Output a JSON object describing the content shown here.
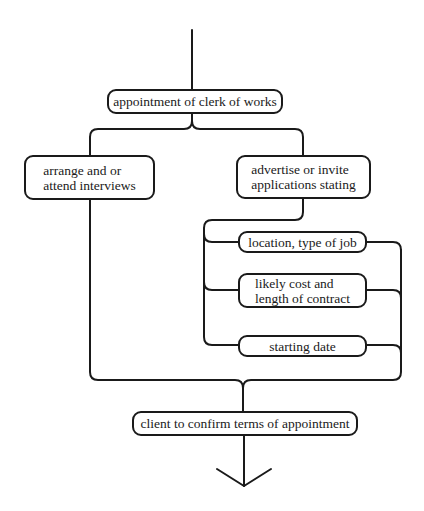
{
  "diagram": {
    "type": "flowchart",
    "colors": {
      "line": "#1a1a1a",
      "background": "#ffffff"
    },
    "nodes": {
      "appointment": {
        "label": "appointment of clerk of works"
      },
      "interviews": {
        "line1": "arrange and or",
        "line2": "attend interviews"
      },
      "advertise": {
        "line1": "advertise or invite",
        "line2": "applications stating"
      },
      "location": {
        "label": "location, type of job"
      },
      "cost": {
        "line1": "likely cost and",
        "line2": "length of contract"
      },
      "starting": {
        "label": "starting date"
      },
      "confirm": {
        "label": "client to confirm terms of appointment"
      }
    },
    "edges": [
      {
        "from": "start",
        "to": "appointment"
      },
      {
        "from": "appointment",
        "to": "interviews"
      },
      {
        "from": "appointment",
        "to": "advertise"
      },
      {
        "from": "advertise",
        "to": "location"
      },
      {
        "from": "advertise",
        "to": "cost"
      },
      {
        "from": "advertise",
        "to": "starting"
      },
      {
        "from": "location",
        "to": "confirm"
      },
      {
        "from": "cost",
        "to": "confirm"
      },
      {
        "from": "starting",
        "to": "confirm"
      },
      {
        "from": "interviews",
        "to": "confirm"
      },
      {
        "from": "confirm",
        "to": "end-arrow"
      }
    ]
  }
}
